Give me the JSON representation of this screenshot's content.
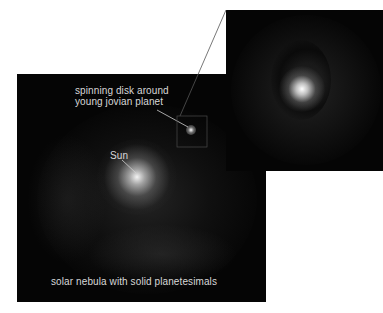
{
  "figure": {
    "main_panel": {
      "labels": {
        "disk_line1": "spinning disk around",
        "disk_line2": "young jovian planet",
        "sun": "Sun",
        "caption": "solar nebula with solid planetesimals"
      }
    },
    "inset_panel": {
      "description": "zoomed view of spinning disk around young jovian planet"
    },
    "colors": {
      "background": "#ffffff",
      "panel": "#050505",
      "text": "#d8d8d8",
      "leader_line": "#cfcfcf"
    }
  }
}
